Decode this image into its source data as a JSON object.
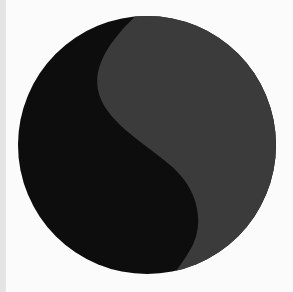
{
  "image": {
    "subject": "circle divided by S-curve",
    "colors": {
      "background": "#fbfbfb",
      "left_strip": "#e4e4e4",
      "dark_half": "#0d0d0d",
      "light_half": "#3b3b3b"
    }
  }
}
